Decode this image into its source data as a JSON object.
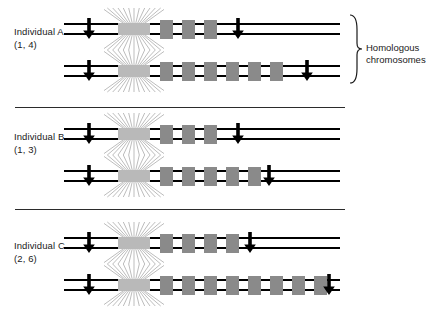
{
  "figure": {
    "title": "",
    "background": "#ffffff",
    "line_color": "#000000",
    "band_color": "#8a8a8a",
    "centromere_color": "#b9b9b9",
    "divider_color": "#2b2b2b"
  },
  "annotation": {
    "brace_label_line1": "Homologous",
    "brace_label_line2": "chromosomes",
    "brace_icon": "curly-brace-right"
  },
  "groups": [
    {
      "id": "individual-a",
      "name": "Individual A",
      "alleles": "(1, 4)",
      "chromosomes": [
        {
          "id": "a-chr-1",
          "repeat_count": 3,
          "band_start": 160,
          "band_pitch": 22,
          "band_width": 13,
          "left_arrow_x": 82,
          "right_arrow_x": 231,
          "line_start": 64,
          "line_end": 340,
          "centromere_x": 118,
          "centromere_w": 32
        },
        {
          "id": "a-chr-2",
          "repeat_count": 6,
          "band_start": 160,
          "band_pitch": 22,
          "band_width": 13,
          "left_arrow_x": 82,
          "right_arrow_x": 300,
          "line_start": 64,
          "line_end": 340,
          "centromere_x": 118,
          "centromere_w": 32
        }
      ]
    },
    {
      "id": "individual-b",
      "name": "Individual B",
      "alleles": "(1, 3)",
      "chromosomes": [
        {
          "id": "b-chr-1",
          "repeat_count": 3,
          "band_start": 160,
          "band_pitch": 22,
          "band_width": 13,
          "left_arrow_x": 82,
          "right_arrow_x": 231,
          "line_start": 64,
          "line_end": 340,
          "centromere_x": 118,
          "centromere_w": 32
        },
        {
          "id": "b-chr-2",
          "repeat_count": 5,
          "band_start": 160,
          "band_pitch": 22,
          "band_width": 13,
          "left_arrow_x": 82,
          "right_arrow_x": 262,
          "line_start": 64,
          "line_end": 340,
          "centromere_x": 118,
          "centromere_w": 32
        }
      ]
    },
    {
      "id": "individual-c",
      "name": "Individual C",
      "alleles": "(2, 6)",
      "chromosomes": [
        {
          "id": "c-chr-1",
          "repeat_count": 4,
          "band_start": 160,
          "band_pitch": 22,
          "band_width": 13,
          "left_arrow_x": 82,
          "right_arrow_x": 243,
          "line_start": 64,
          "line_end": 340,
          "centromere_x": 118,
          "centromere_w": 32
        },
        {
          "id": "c-chr-2",
          "repeat_count": 8,
          "band_start": 160,
          "band_pitch": 22,
          "band_width": 13,
          "left_arrow_x": 82,
          "right_arrow_x": 322,
          "line_start": 64,
          "line_end": 340,
          "centromere_x": 118,
          "centromere_w": 32
        }
      ]
    }
  ],
  "dividers": [
    {
      "x": 15,
      "y": 107,
      "width": 330
    },
    {
      "x": 15,
      "y": 209,
      "width": 330
    }
  ],
  "layout": {
    "group_tops": [
      8,
      113,
      222
    ],
    "chrom_offsets": [
      10,
      52
    ],
    "label_offset": 18
  }
}
